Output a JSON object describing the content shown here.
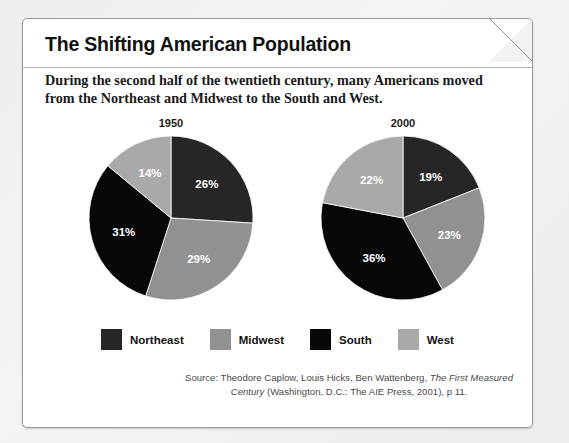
{
  "card": {
    "title": "The Shifting American Population",
    "subtitle": "During the second half of the twentieth century, many Americans moved from the Northeast and Midwest to the South and West.",
    "source_line1_pre": "Source: Theodore Caplow, Louis Hicks, Ben Wattenberg, ",
    "source_line1_italic": "The First",
    "source_line2_italic": "Measured Century",
    "source_line2_post": " (Washington, D.C.: The AIE Press, 2001), p 11."
  },
  "colors": {
    "northeast": "#262626",
    "midwest": "#919191",
    "south": "#070707",
    "west": "#a9a9a9",
    "page_background": "#f0f0f0",
    "card_background": "#ffffff",
    "card_border": "#9a9a9a",
    "label_text": "#ffffff"
  },
  "legend": {
    "items": [
      {
        "label": "Northeast",
        "color": "#262626",
        "swatch": "legend-swatch-northeast"
      },
      {
        "label": "Midwest",
        "color": "#919191",
        "swatch": "legend-swatch-midwest"
      },
      {
        "label": "South",
        "color": "#070707",
        "swatch": "legend-swatch-south"
      },
      {
        "label": "West",
        "color": "#a9a9a9",
        "swatch": "legend-swatch-west"
      }
    ]
  },
  "chart_data": [
    {
      "type": "pie",
      "title": "1950",
      "categories": [
        "Northeast",
        "Midwest",
        "South",
        "West"
      ],
      "values": [
        26,
        29,
        31,
        14
      ],
      "labels": [
        "26%",
        "29%",
        "31%",
        "14%"
      ],
      "colors": [
        "#262626",
        "#919191",
        "#070707",
        "#a9a9a9"
      ],
      "start_angle_deg": 0,
      "direction": "clockwise",
      "legend_position": "bottom"
    },
    {
      "type": "pie",
      "title": "2000",
      "categories": [
        "Northeast",
        "Midwest",
        "South",
        "West"
      ],
      "values": [
        19,
        23,
        36,
        22
      ],
      "labels": [
        "19%",
        "23%",
        "36%",
        "22%"
      ],
      "colors": [
        "#262626",
        "#919191",
        "#070707",
        "#a9a9a9"
      ],
      "start_angle_deg": 0,
      "direction": "clockwise",
      "legend_position": "bottom"
    }
  ]
}
